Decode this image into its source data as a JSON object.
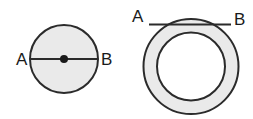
{
  "figure": {
    "title": "Circle and annulus geometry diagram",
    "background_color": "#ffffff",
    "stroke_color": "#2b2b2b",
    "fill_color": "#eaeaea",
    "label_color": "#1a1a1a",
    "shapes": [
      {
        "id": "left-circle",
        "type": "circle",
        "description": "Shaded circle with diameter AB drawn through marked center point",
        "center": {
          "x": 64,
          "y": 59
        },
        "radius": 34,
        "fill": "#eaeaea",
        "stroke": "#2b2b2b",
        "stroke_width": 2,
        "center_dot": {
          "x": 64,
          "y": 59,
          "radius": 4,
          "fill": "#1a1a1a"
        },
        "segment": {
          "name": "diameter",
          "x1": 30,
          "y1": 59,
          "x2": 98,
          "y2": 59,
          "stroke": "#2b2b2b",
          "stroke_width": 2
        },
        "labels": [
          {
            "text": "A",
            "x": 16,
            "y": 65,
            "anchor": "start"
          },
          {
            "text": "B",
            "x": 101,
            "y": 65,
            "anchor": "start"
          }
        ]
      },
      {
        "id": "right-annulus",
        "type": "annulus",
        "description": "Shaded ring (annulus) with horizontal chord AB across the upper region",
        "center": {
          "x": 191,
          "y": 66.5
        },
        "outer_radius": 47.5,
        "inner_radius": 34,
        "fill": "#eaeaea",
        "stroke": "#2b2b2b",
        "stroke_width": 2,
        "segment": {
          "name": "chord",
          "x1": 149,
          "y1": 24.5,
          "x2": 231,
          "y2": 24.5,
          "stroke": "#2b2b2b",
          "stroke_width": 2
        },
        "labels": [
          {
            "text": "A",
            "x": 132,
            "y": 22,
            "anchor": "start"
          },
          {
            "text": "B",
            "x": 234,
            "y": 25,
            "anchor": "start"
          }
        ]
      }
    ]
  }
}
